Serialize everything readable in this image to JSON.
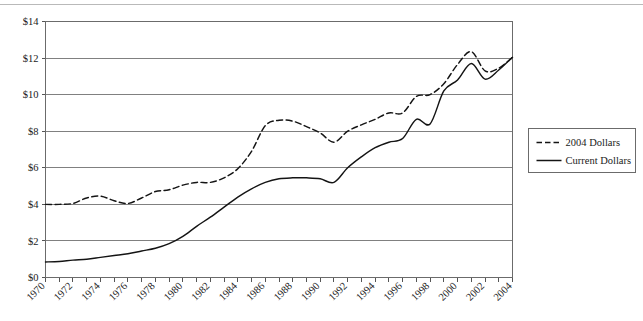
{
  "chart_data": {
    "type": "line",
    "title": "",
    "subtitle": "",
    "xlabel": "",
    "ylabel": "",
    "xlim": [
      1970,
      2004
    ],
    "ylim": [
      0,
      14
    ],
    "grid": true,
    "legend_position": "right",
    "x": [
      1970,
      1971,
      1972,
      1973,
      1974,
      1975,
      1976,
      1977,
      1978,
      1979,
      1980,
      1981,
      1982,
      1983,
      1984,
      1985,
      1986,
      1987,
      1988,
      1989,
      1990,
      1991,
      1992,
      1993,
      1994,
      1995,
      1996,
      1997,
      1998,
      1999,
      2000,
      2001,
      2002,
      2003,
      2004
    ],
    "x_tick_labels": [
      "1970",
      "1972",
      "1974",
      "1976",
      "1978",
      "1980",
      "1982",
      "1984",
      "1986",
      "1988",
      "1990",
      "1992",
      "1994",
      "1996",
      "1998",
      "2000",
      "2002",
      "2004"
    ],
    "y_tick_values": [
      0,
      2,
      4,
      6,
      8,
      10,
      12,
      14
    ],
    "y_tick_labels": [
      "$0",
      "$2",
      "$4",
      "$6",
      "$8",
      "$10",
      "$12",
      "$14"
    ],
    "series": [
      {
        "name": "2004 Dollars",
        "style": "dashed",
        "color": "#141414",
        "values": [
          4.0,
          4.0,
          4.05,
          4.35,
          4.45,
          4.2,
          4.05,
          4.35,
          4.7,
          4.8,
          5.05,
          5.2,
          5.2,
          5.45,
          5.95,
          6.9,
          8.3,
          8.6,
          8.55,
          8.25,
          7.9,
          7.4,
          8.0,
          8.35,
          8.65,
          9.0,
          9.0,
          9.9,
          10.0,
          10.6,
          11.65,
          12.35,
          11.3,
          11.45,
          12.05
        ]
      },
      {
        "name": "Current Dollars",
        "style": "solid",
        "color": "#141414",
        "values": [
          0.85,
          0.88,
          0.95,
          1.0,
          1.1,
          1.2,
          1.3,
          1.45,
          1.6,
          1.85,
          2.25,
          2.8,
          3.3,
          3.85,
          4.4,
          4.85,
          5.2,
          5.4,
          5.45,
          5.45,
          5.4,
          5.2,
          6.0,
          6.6,
          7.1,
          7.4,
          7.6,
          8.65,
          8.4,
          10.2,
          10.8,
          11.7,
          10.85,
          11.35,
          12.05
        ]
      }
    ]
  },
  "legend": {
    "entries": [
      {
        "label": "2004 Dollars",
        "style": "dashed"
      },
      {
        "label": "Current Dollars",
        "style": "solid"
      }
    ]
  }
}
